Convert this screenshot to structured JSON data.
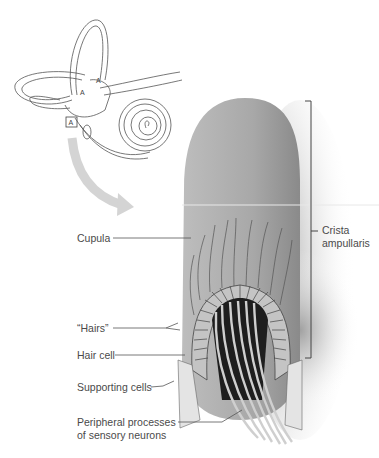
{
  "figure": {
    "inset": {
      "description": "Inner ear (semicircular canals, vestibule, cochlea)",
      "ampulla_markers": [
        "A",
        "A",
        "A"
      ],
      "highlight_box_marker": "A"
    },
    "labels": {
      "cupula": "Cupula",
      "hairs": "“Hairs”",
      "hair_cell": "Hair cell",
      "supporting_cells": "Supporting cells",
      "peripheral_processes_line1": "Peripheral processes",
      "peripheral_processes_line2": "of sensory neurons",
      "crista_line1": "Crista",
      "crista_line2": "ampullaris"
    },
    "colors": {
      "cupula_fill": "#a9a9a9",
      "line": "#555555",
      "text": "#4a4a4a",
      "arrow": "#d4d4d4"
    }
  }
}
